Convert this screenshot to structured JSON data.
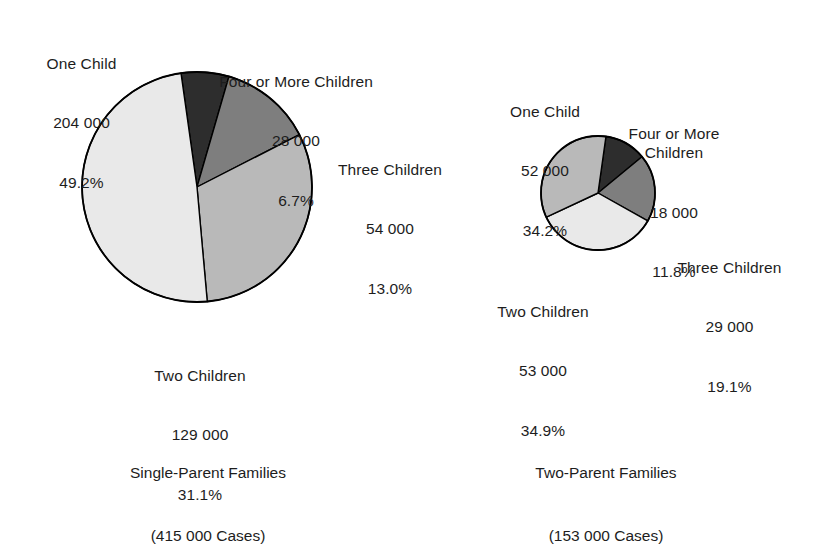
{
  "chart_data": [
    {
      "type": "pie",
      "title": "Single-Parent Families",
      "subtitle": "(415 000 Cases)",
      "total_label": "415 000",
      "total_cases": 415000,
      "categories": [
        "One Child",
        "Two Children",
        "Three Children",
        "Four or More Children"
      ],
      "values": [
        204000,
        129000,
        54000,
        28000
      ],
      "value_labels": [
        "204 000",
        "129 000",
        "54 000",
        "28 000"
      ],
      "percentages": [
        49.2,
        31.1,
        13.0,
        6.7
      ],
      "percent_labels": [
        "49.2%",
        "31.1%",
        "13.0%",
        "6.7%"
      ],
      "colors": [
        "#e9e9e9",
        "#b9b9b9",
        "#7e7e7e",
        "#2d2d2d"
      ],
      "legend": "none",
      "grid": false,
      "xlabel": "",
      "ylabel": ""
    },
    {
      "type": "pie",
      "title": "Two-Parent Families",
      "subtitle": "(153 000 Cases)",
      "total_label": "153 000",
      "total_cases": 153000,
      "categories": [
        "One Child",
        "Two Children",
        "Three Children",
        "Four or More Children"
      ],
      "values": [
        52000,
        53000,
        29000,
        18000
      ],
      "value_labels": [
        "52 000",
        "53 000",
        "29 000",
        "18 000"
      ],
      "percentages": [
        34.2,
        34.9,
        19.1,
        11.8
      ],
      "percent_labels": [
        "34.2%",
        "34.9%",
        "19.1%",
        "11.8%"
      ],
      "colors": [
        "#b9b9b9",
        "#e9e9e9",
        "#7e7e7e",
        "#2d2d2d"
      ],
      "legend": "none",
      "grid": false,
      "xlabel": "",
      "ylabel": ""
    }
  ],
  "left_chart": {
    "caption": {
      "title": "Single-Parent Families",
      "subtitle": "(415 000 Cases)"
    },
    "labels": {
      "one_child": {
        "name": "One Child",
        "value": "204 000",
        "pct": "49.2%"
      },
      "two_child": {
        "name": "Two Children",
        "value": "129 000",
        "pct": "31.1%"
      },
      "three_child": {
        "name": "Three Children",
        "value": "54 000",
        "pct": "13.0%"
      },
      "four_child": {
        "name": "Four or More Children",
        "value": "28 000",
        "pct": "6.7%"
      }
    }
  },
  "right_chart": {
    "caption": {
      "title": "Two-Parent Families",
      "subtitle": "(153 000 Cases)"
    },
    "labels": {
      "one_child": {
        "name": "One Child",
        "value": "52 000",
        "pct": "34.2%"
      },
      "two_child": {
        "name": "Two Children",
        "value": "53 000",
        "pct": "34.9%"
      },
      "three_child": {
        "name": "Three Children",
        "value": "29 000",
        "pct": "19.1%"
      },
      "four_child": {
        "name": "Four or More\nChildren",
        "value": "18 000",
        "pct": "11.8%"
      }
    }
  },
  "style": {
    "background": "#ffffff",
    "text_color": "#1d1d1d",
    "outline_color": "#000000",
    "shade_lightest": "#e9e9e9",
    "shade_light": "#b9b9b9",
    "shade_mid": "#7e7e7e",
    "shade_dark": "#2d2d2d"
  }
}
